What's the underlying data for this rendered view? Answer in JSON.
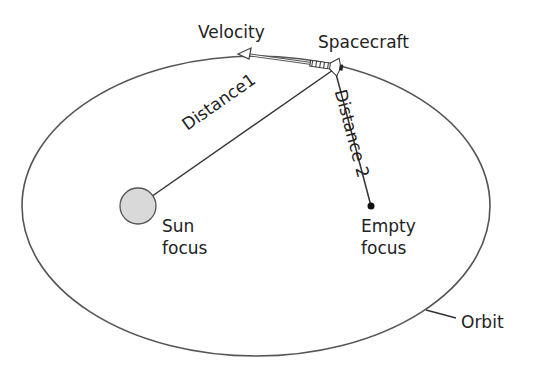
{
  "diagram": {
    "labels": {
      "velocity": "Velocity",
      "spacecraft": "Spacecraft",
      "distance1": "Distance1",
      "distance2": "Distance 2",
      "sun_focus_line1": "Sun",
      "sun_focus_line2": "focus",
      "empty_focus_line1": "Empty",
      "empty_focus_line2": "focus",
      "orbit": "Orbit"
    },
    "colors": {
      "line": "#333333",
      "sun_fill": "#d9d9d9",
      "sun_stroke": "#555555"
    },
    "icons": [
      "spacecraft-icon",
      "sun-icon",
      "arrow-left-icon"
    ]
  }
}
